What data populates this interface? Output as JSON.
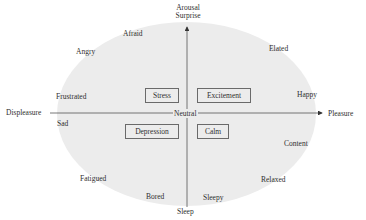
{
  "diagram": {
    "type": "circumplex-model-of-affect",
    "axes": {
      "top": [
        "Arousal",
        "Surprise"
      ],
      "bottom": "Sleep",
      "left": "Displeasure",
      "right": "Pleasure",
      "origin": "Neutral"
    },
    "emotions": {
      "afraid": "Afraid",
      "angry": "Angry",
      "frustrated": "Frustrated",
      "sad": "Sad",
      "fatigued": "Fatigued",
      "bored": "Bored",
      "sleepy": "Sleepy",
      "relaxed": "Relaxed",
      "content": "Content",
      "happy": "Happy",
      "elated": "Elated"
    },
    "boxed_states": {
      "stress": "Stress",
      "excitement": "Excitement",
      "depression": "Depression",
      "calm": "Calm"
    },
    "colors": {
      "ellipse_fill": "#ececec",
      "line": "#555555",
      "text": "#2f2f2f"
    }
  }
}
